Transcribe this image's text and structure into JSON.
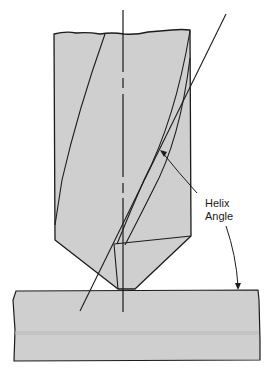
{
  "diagram": {
    "labels": {
      "helix_line1": "Helix",
      "helix_line2": "Angle"
    },
    "colors": {
      "fill": "#cfcfcf",
      "stroke": "#1c1c1c",
      "background": "#ffffff"
    }
  }
}
